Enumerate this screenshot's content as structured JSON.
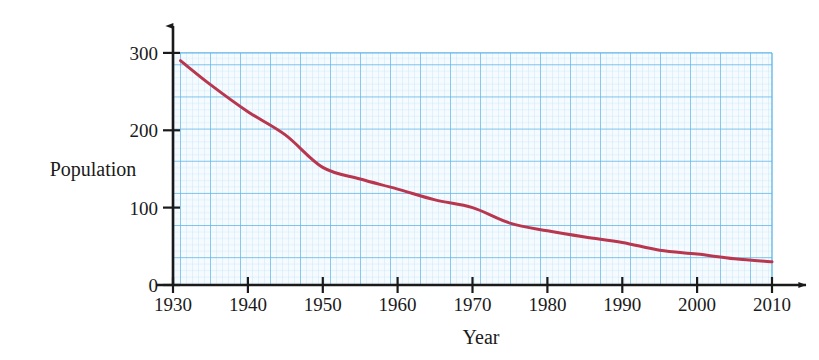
{
  "chart_data": {
    "type": "line",
    "title": "",
    "subtitle": "",
    "xlabel": "Year",
    "ylabel": "Population",
    "xlim": [
      1930,
      2010
    ],
    "ylim": [
      0,
      300
    ],
    "grid": true,
    "grid_style": "graph-paper",
    "legend": "none",
    "x_ticks": [
      1930,
      1940,
      1950,
      1960,
      1970,
      1980,
      1990,
      2000,
      2010
    ],
    "x_tick_labels": [
      "1930",
      "1940",
      "1950",
      "1960",
      "1970",
      "1980",
      "1990",
      "2000",
      "2010"
    ],
    "y_ticks": [
      0,
      100,
      200,
      300
    ],
    "y_tick_labels": [
      "0",
      "100",
      "200",
      "300"
    ],
    "series": [
      {
        "name": "Population",
        "color": "#b8374f",
        "line_width": 3,
        "x": [
          1931,
          1935,
          1940,
          1945,
          1950,
          1955,
          1960,
          1965,
          1970,
          1975,
          1980,
          1985,
          1990,
          1995,
          2000,
          2005,
          2010
        ],
        "values": [
          290,
          259,
          224,
          194,
          152,
          137,
          124,
          110,
          100,
          80,
          70,
          62,
          55,
          45,
          40,
          34,
          30
        ]
      }
    ],
    "annotations": []
  },
  "axes": {
    "x_title": "Year",
    "y_title": "Population",
    "x_tick_labels": [
      "1930",
      "1940",
      "1950",
      "1960",
      "1970",
      "1980",
      "1990",
      "2000",
      "2010"
    ],
    "y_tick_labels": [
      "0",
      "100",
      "200",
      "300"
    ]
  },
  "colors": {
    "curve": "#b8374f",
    "axis": "#1a1a1a",
    "grid_minor": "#bfe0f5",
    "grid_major": "#5ab3e8",
    "background": "#ffffff",
    "grid_fill": "#f3fafe"
  }
}
